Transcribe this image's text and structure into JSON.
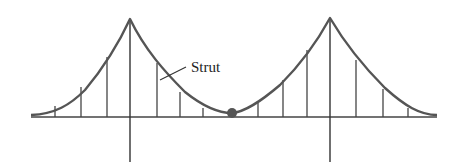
{
  "diagram": {
    "type": "suspension-bridge-cable",
    "labels": {
      "strut": "Strut"
    },
    "colors": {
      "cable": "#555555",
      "lines": "#444444",
      "background": "#ffffff"
    },
    "deck": {
      "x1": 31,
      "x2": 437,
      "y": 117
    },
    "towers": [
      {
        "x": 130,
        "top": 19,
        "bottom": 162
      },
      {
        "x": 330,
        "top": 18,
        "bottom": 162
      }
    ],
    "joint": {
      "x": 232,
      "y": 113,
      "r": 5
    },
    "struts_left": [
      55,
      81,
      107,
      157,
      180,
      203
    ],
    "struts_right": [
      258,
      283,
      307,
      356,
      383,
      408
    ]
  }
}
